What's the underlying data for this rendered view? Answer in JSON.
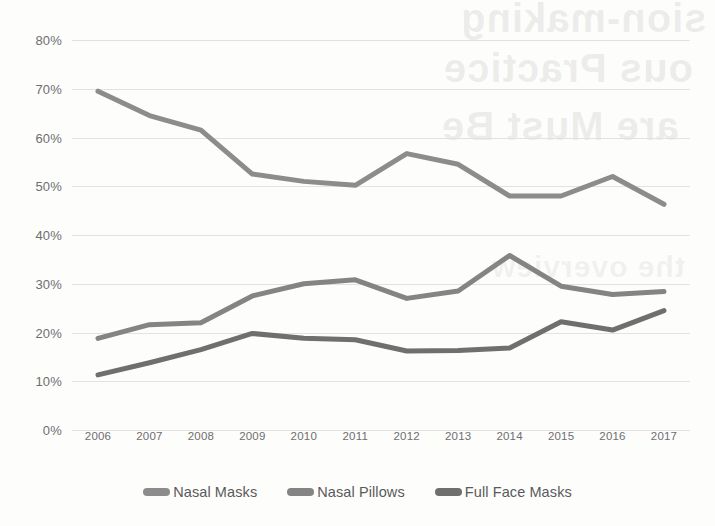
{
  "chart_data": {
    "type": "line",
    "title": "",
    "subtitle": "",
    "xlabel": "",
    "ylabel": "",
    "categories": [
      "2006",
      "2007",
      "2008",
      "2009",
      "2010",
      "2011",
      "2012",
      "2013",
      "2014",
      "2015",
      "2016",
      "2017"
    ],
    "ylim": [
      0,
      80
    ],
    "ytick_values": [
      0,
      10,
      20,
      30,
      40,
      50,
      60,
      70,
      80
    ],
    "ytick_labels": [
      "0%",
      "10%",
      "20%",
      "30%",
      "40%",
      "50%",
      "60%",
      "70%",
      "80%"
    ],
    "grid": true,
    "legend_position": "bottom",
    "series": [
      {
        "name": "Nasal Masks",
        "color": "#8c8c8c",
        "values": [
          69.5,
          64.5,
          61.5,
          52.5,
          51.0,
          50.2,
          56.7,
          54.5,
          48.0,
          48.0,
          52.0,
          46.3
        ]
      },
      {
        "name": "Nasal Pillows",
        "color": "#848484",
        "values": [
          18.8,
          21.6,
          22.0,
          27.5,
          30.0,
          30.8,
          27.0,
          28.5,
          35.8,
          29.5,
          27.8,
          28.4
        ]
      },
      {
        "name": "Full Face Masks",
        "color": "#6f6f6f",
        "values": [
          11.3,
          13.8,
          16.5,
          19.8,
          18.8,
          18.5,
          16.2,
          16.3,
          16.8,
          22.2,
          20.5,
          24.5
        ]
      }
    ]
  },
  "legend": {
    "items": [
      {
        "label": "Nasal Masks"
      },
      {
        "label": "Nasal Pillows"
      },
      {
        "label": "Full Face Masks"
      }
    ]
  },
  "watermark": {
    "line1": "sion-making",
    "line2": "ous Practice",
    "line3": "are Must Be",
    "line4": "the overview"
  }
}
